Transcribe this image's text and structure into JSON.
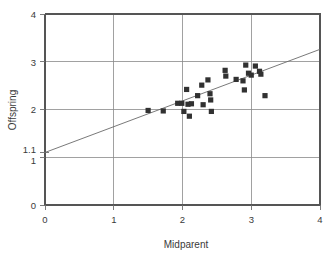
{
  "chart_data": {
    "type": "scatter",
    "title": "",
    "xlabel": "Midparent",
    "ylabel": "Offspring",
    "xlim": [
      0,
      4
    ],
    "ylim": [
      0,
      4
    ],
    "xticks": [
      "0",
      "1",
      "2",
      "3",
      "4"
    ],
    "xtick_values": [
      0,
      1,
      2,
      3,
      4
    ],
    "yticks": [
      "0",
      "1",
      "2",
      "3",
      "4"
    ],
    "ytick_values": [
      0,
      1,
      2,
      3,
      4
    ],
    "extra_ytick_labels": [
      {
        "label": "1.1",
        "value": 1.1
      }
    ],
    "grid": "major gridlines at x = 1, 2, 3 and y = 1, 2, 3",
    "legend": "none",
    "marker_color": "#313131",
    "marker_shape": "square",
    "line_color": "#6a6a6a",
    "annotations": [
      "Y-intercept of fitted line highlighted on axis as 1.1"
    ],
    "fit_line": {
      "label": "regression line",
      "intercept": 1.1,
      "slope": 0.54,
      "x_start": 0,
      "y_start": 1.1,
      "x_end": 4,
      "y_end": 3.26
    },
    "points": [
      {
        "x": 1.5,
        "y": 1.98
      },
      {
        "x": 1.72,
        "y": 1.97
      },
      {
        "x": 1.93,
        "y": 2.13
      },
      {
        "x": 1.99,
        "y": 2.13
      },
      {
        "x": 2.02,
        "y": 1.96
      },
      {
        "x": 2.06,
        "y": 2.42
      },
      {
        "x": 2.08,
        "y": 2.11
      },
      {
        "x": 2.1,
        "y": 1.86
      },
      {
        "x": 2.13,
        "y": 2.12
      },
      {
        "x": 2.22,
        "y": 2.29
      },
      {
        "x": 2.28,
        "y": 2.51
      },
      {
        "x": 2.3,
        "y": 2.1
      },
      {
        "x": 2.37,
        "y": 2.62
      },
      {
        "x": 2.4,
        "y": 2.33
      },
      {
        "x": 2.41,
        "y": 2.2
      },
      {
        "x": 2.42,
        "y": 1.96
      },
      {
        "x": 2.62,
        "y": 2.82
      },
      {
        "x": 2.63,
        "y": 2.7
      },
      {
        "x": 2.78,
        "y": 2.63
      },
      {
        "x": 2.88,
        "y": 2.6
      },
      {
        "x": 2.9,
        "y": 2.41
      },
      {
        "x": 2.92,
        "y": 2.93
      },
      {
        "x": 2.96,
        "y": 2.76
      },
      {
        "x": 3.0,
        "y": 2.72
      },
      {
        "x": 3.06,
        "y": 2.91
      },
      {
        "x": 3.12,
        "y": 2.8
      },
      {
        "x": 3.14,
        "y": 2.74
      },
      {
        "x": 3.2,
        "y": 2.29
      }
    ]
  }
}
